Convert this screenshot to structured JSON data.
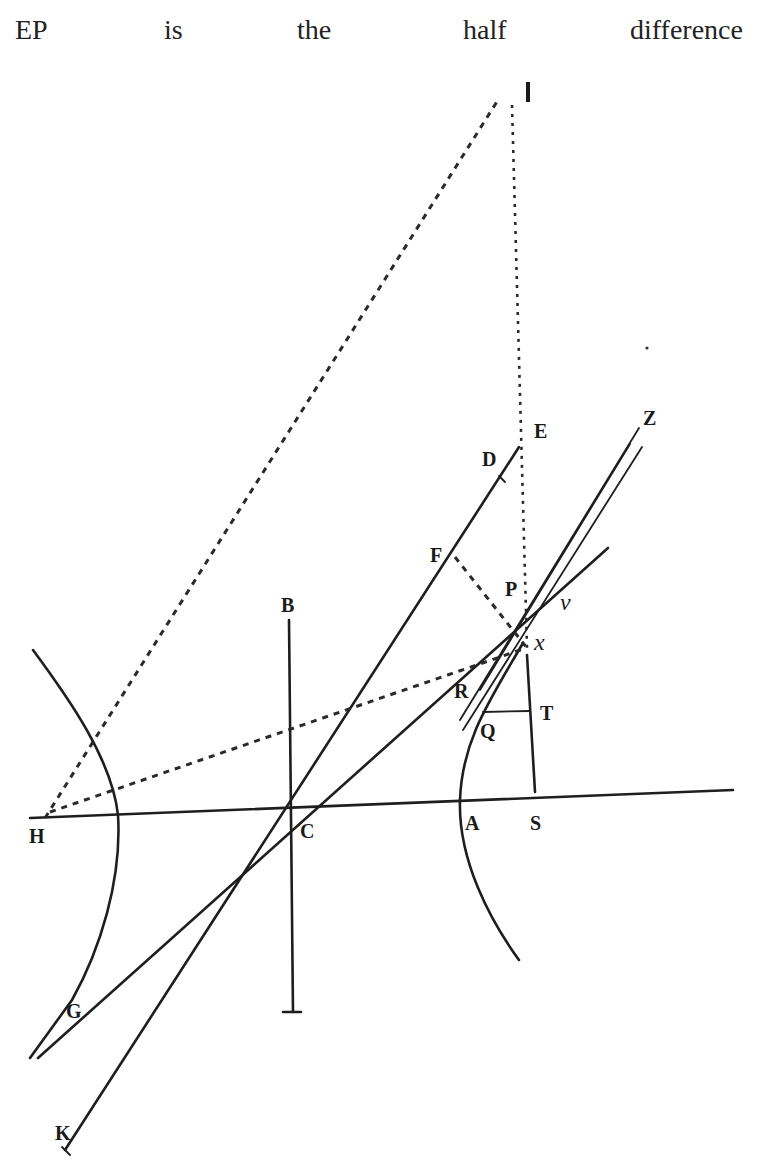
{
  "caption": {
    "words": [
      "EP",
      "is",
      "the",
      "half",
      "difference"
    ]
  },
  "figure": {
    "points": {
      "I": "I",
      "E": "E",
      "D": "D",
      "Z": "Z",
      "F": "F",
      "P": "P",
      "v": "v",
      "x": "x",
      "B": "B",
      "R": "R",
      "T": "T",
      "Q": "Q",
      "H": "H",
      "C": "C",
      "A": "A",
      "S": "S",
      "G": "G",
      "K": "K"
    }
  }
}
